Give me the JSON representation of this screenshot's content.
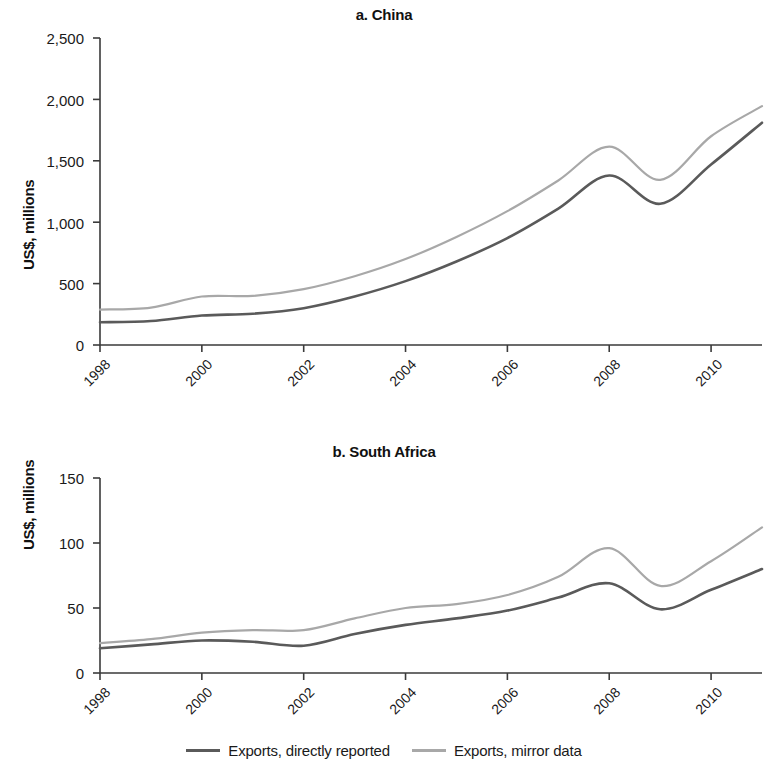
{
  "figure": {
    "series_colors": {
      "directly_reported": "#5a5a5a",
      "mirror_data": "#a8a8a8"
    },
    "axis_color": "#3b3b3b"
  },
  "legend": {
    "items": [
      {
        "label": "Exports, directly reported",
        "color": "#5a5a5a",
        "width": 2.6
      },
      {
        "label": "Exports, mirror data",
        "color": "#a8a8a8",
        "width": 2.2
      }
    ]
  },
  "panel_a": {
    "title": "a. China",
    "ylabel": "US$, millions"
  },
  "panel_b": {
    "title": "b. South Africa",
    "ylabel": "US$, millions"
  },
  "chart_data": [
    {
      "type": "line",
      "title": "a. China",
      "xlabel": "",
      "ylabel": "US$, millions",
      "xlim": [
        1998,
        2011
      ],
      "ylim": [
        0,
        2500
      ],
      "yticks": [
        0,
        500,
        1000,
        1500,
        2000,
        2500
      ],
      "ytick_labels": [
        "0",
        "500",
        "1,000",
        "1,500",
        "2,000",
        "2,500"
      ],
      "xticks": [
        1998,
        2000,
        2002,
        2004,
        2006,
        2008,
        2010
      ],
      "xtick_labels": [
        "1998",
        "2000",
        "2002",
        "2004",
        "2006",
        "2008",
        "2010"
      ],
      "grid": false,
      "legend_position": "bottom",
      "x": [
        1998,
        1999,
        2000,
        2001,
        2002,
        2003,
        2004,
        2005,
        2006,
        2007,
        2008,
        2009,
        2010,
        2011
      ],
      "series": [
        {
          "name": "Exports, directly reported",
          "color": "#5a5a5a",
          "values": [
            185,
            195,
            240,
            255,
            300,
            395,
            520,
            680,
            870,
            1110,
            1380,
            1150,
            1470,
            1810
          ]
        },
        {
          "name": "Exports, mirror data",
          "color": "#a8a8a8",
          "values": [
            288,
            305,
            395,
            400,
            455,
            560,
            700,
            880,
            1090,
            1340,
            1615,
            1345,
            1700,
            1945
          ]
        }
      ]
    },
    {
      "type": "line",
      "title": "b. South Africa",
      "xlabel": "",
      "ylabel": "US$, millions",
      "xlim": [
        1998,
        2011
      ],
      "ylim": [
        0,
        150
      ],
      "yticks": [
        0,
        50,
        100,
        150
      ],
      "ytick_labels": [
        "0",
        "50",
        "100",
        "150"
      ],
      "xticks": [
        1998,
        2000,
        2002,
        2004,
        2006,
        2008,
        2010
      ],
      "xtick_labels": [
        "1998",
        "2000",
        "2002",
        "2004",
        "2006",
        "2008",
        "2010"
      ],
      "grid": false,
      "legend_position": "bottom",
      "x": [
        1998,
        1999,
        2000,
        2001,
        2002,
        2003,
        2004,
        2005,
        2006,
        2007,
        2008,
        2009,
        2010,
        2011
      ],
      "series": [
        {
          "name": "Exports, directly reported",
          "color": "#5a5a5a",
          "values": [
            19,
            22,
            25,
            24,
            21,
            30,
            37,
            42,
            48,
            58,
            69,
            49,
            64,
            80
          ]
        },
        {
          "name": "Exports, mirror data",
          "color": "#a8a8a8",
          "values": [
            23,
            26,
            31,
            33,
            33,
            42,
            50,
            53,
            60,
            74,
            96,
            67,
            86,
            112
          ]
        }
      ]
    }
  ]
}
